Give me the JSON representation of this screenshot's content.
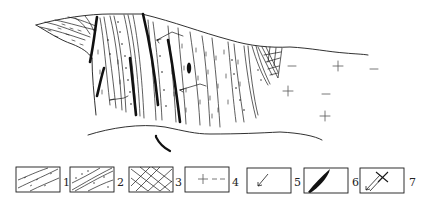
{
  "diagram": {
    "type": "geological-cross-section",
    "line_color": "#1a1a1a",
    "background": "#ffffff",
    "regions": [
      {
        "id": "schist",
        "description": "schist / dashed foliated rock on left upper limb"
      },
      {
        "id": "dotted-sandstone",
        "description": "dotted layers within steep strata"
      },
      {
        "id": "crosshatch-zone",
        "description": "cross-hatched wedge zone"
      },
      {
        "id": "granite",
        "description": "granite body with plus and dash symbols"
      }
    ],
    "arrow_bottom": "curved arrow below section"
  },
  "legend": {
    "items": [
      {
        "num": "1",
        "symbol": "foliated-schist"
      },
      {
        "num": "2",
        "symbol": "dotted-foliated-rock"
      },
      {
        "num": "3",
        "symbol": "crosshatch"
      },
      {
        "num": "4",
        "symbol": "plus-dash-granite"
      },
      {
        "num": "5",
        "symbol": "arrow"
      },
      {
        "num": "6",
        "symbol": "black-lens-dike"
      },
      {
        "num": "7",
        "symbol": "arrow-with-cross"
      }
    ]
  }
}
